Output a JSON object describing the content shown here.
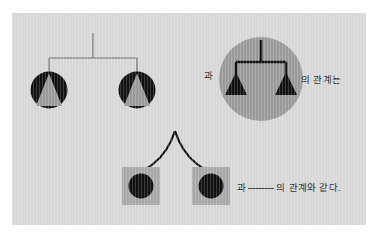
{
  "panel": {
    "background_color": "#d7d7d7",
    "page_background_color": "#ffffff"
  },
  "colors": {
    "dark": "#111111",
    "mid_gray": "#9a9a9a",
    "light_gray": "#d7d7d7",
    "square_gray": "#a8a8a8",
    "connector_light": "#8c8c8c",
    "text": "#2a2a2a"
  },
  "captions": {
    "gwa_top": "과",
    "relation_is": "의 관계는",
    "bottom_prefix": "과",
    "bottom_suffix": "의 관계와 같다.",
    "blank": ""
  },
  "groups": {
    "top_left": {
      "name": "두 개의 원 안 삼각형",
      "node_count": 2,
      "shape": "circle-with-triangle",
      "circle_fill": "#111111",
      "triangle_fill": "#9a9a9a",
      "connector_style": "bracket",
      "connector_color": "#8c8c8c"
    },
    "top_right": {
      "name": "회색 원 안 두 삼각형",
      "node_count": 2,
      "shape": "triangle",
      "enclosure": "circle",
      "enclosure_fill": "#9a9a9a",
      "triangle_fill": "#111111",
      "connector_style": "bracket",
      "connector_color": "#111111"
    },
    "bottom": {
      "name": "두 개의 사각형 안 원",
      "node_count": 2,
      "shape": "square-with-circle",
      "square_fill": "#a8a8a8",
      "circle_fill": "#111111",
      "connector_style": "arch-curve",
      "connector_color": "#111111"
    }
  }
}
